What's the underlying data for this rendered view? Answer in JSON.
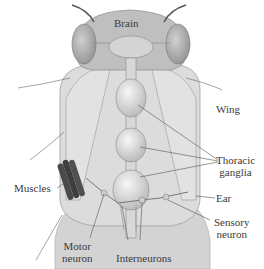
{
  "diagram": {
    "labels": {
      "brain": "Brain",
      "wing": "Wing",
      "thoracic_ganglia_1": "Thoracic",
      "thoracic_ganglia_2": "ganglia",
      "muscles": "Muscles",
      "ear": "Ear",
      "sensory_neuron_1": "Sensory",
      "sensory_neuron_2": "neuron",
      "motor_neuron_1": "Motor",
      "motor_neuron_2": "neuron",
      "interneurons": "Interneurons"
    },
    "colors": {
      "body": "#d8d8d8",
      "head": "#bdbdbd",
      "ganglia": "#e6e6e6",
      "muscle": "#4a4a4a",
      "line": "#555555"
    }
  }
}
